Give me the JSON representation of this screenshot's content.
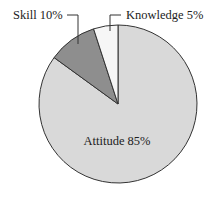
{
  "chart_data": {
    "type": "pie",
    "title": "",
    "categories": [
      "Attitude",
      "Skill",
      "Knowledge"
    ],
    "values": [
      85,
      10,
      5
    ],
    "labels": [
      "Attitude 85%",
      "Skill 10%",
      "Knowledge 5%"
    ],
    "colors": [
      "#d9d9d9",
      "#8e8e8e",
      "#f6f6f6"
    ],
    "start_angle_deg": 0,
    "direction": "clockwise",
    "legend": "none",
    "label_positions": {
      "Attitude": "inside",
      "Skill": "outside-leader-top-left",
      "Knowledge": "outside-leader-top-right"
    }
  },
  "geometry": {
    "cx": 118,
    "cy": 104,
    "r": 79
  }
}
